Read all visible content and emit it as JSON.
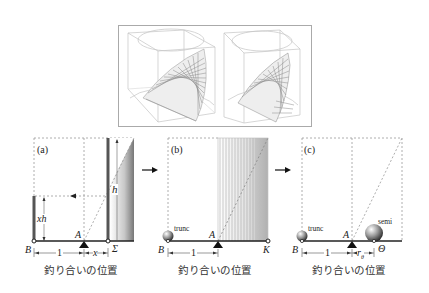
{
  "figure": {
    "top_panel": {
      "description": "two 3D wireframe cylinder-in-cube renderings with hatched wedge surface",
      "views": [
        "left-view",
        "right-view"
      ]
    },
    "panels": [
      {
        "id": "a",
        "tag": "(a)",
        "labels": {
          "B": "B",
          "A": "A",
          "Sigma": "Σ",
          "h": "h",
          "xh": "xh",
          "one": "1",
          "x": "x"
        },
        "caption": "釣り合いの位置"
      },
      {
        "id": "b",
        "tag": "(b)",
        "labels": {
          "B": "B",
          "A": "A",
          "K": "K",
          "trunc": "trunc",
          "one": "1"
        },
        "caption": "釣り合いの位置"
      },
      {
        "id": "c",
        "tag": "(c)",
        "labels": {
          "B": "B",
          "A": "A",
          "Theta": "Θ",
          "trunc": "trunc",
          "semi": "semi",
          "one": "1",
          "r": "r",
          "r_sub": "θ"
        },
        "caption": "釣り合いの位置"
      }
    ],
    "arrows": [
      "a-to-b",
      "b-to-c"
    ]
  }
}
